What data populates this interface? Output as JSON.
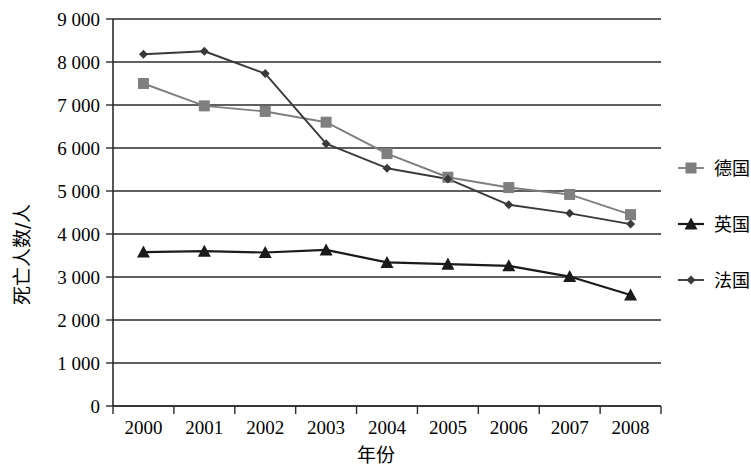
{
  "chart_data": {
    "type": "line",
    "title": "",
    "xlabel": "年份",
    "ylabel": "死亡人数/人",
    "categories": [
      "2000",
      "2001",
      "2002",
      "2003",
      "2004",
      "2005",
      "2006",
      "2007",
      "2008"
    ],
    "x": [
      2000,
      2001,
      2002,
      2003,
      2004,
      2005,
      2006,
      2007,
      2008
    ],
    "ylim": [
      0,
      9000
    ],
    "ytick_values": [
      0,
      1000,
      2000,
      3000,
      4000,
      5000,
      6000,
      7000,
      8000,
      9000
    ],
    "ytick_labels": [
      "0",
      "1 000",
      "2 000",
      "3 000",
      "4 000",
      "5 000",
      "6 000",
      "7 000",
      "8 000",
      "9 000"
    ],
    "grid": true,
    "grid_axis": "y",
    "legend_position": "right",
    "series": [
      {
        "name": "德国",
        "marker": "square",
        "color": "#7f7f7f",
        "values": [
          7500,
          6980,
          6850,
          6600,
          5870,
          5320,
          5080,
          4920,
          4450
        ]
      },
      {
        "name": "英国",
        "marker": "triangle",
        "color": "#1a1a1a",
        "values": [
          3580,
          3600,
          3570,
          3630,
          3340,
          3300,
          3260,
          3010,
          2580
        ]
      },
      {
        "name": "法国",
        "marker": "diamond",
        "color": "#3a3a3a",
        "values": [
          8180,
          8250,
          7730,
          6100,
          5530,
          5280,
          4680,
          4480,
          4230
        ]
      }
    ]
  },
  "axes": {
    "y_title": "死亡人数/人",
    "x_title": "年份"
  },
  "legend": {
    "entries": [
      {
        "label": "德国"
      },
      {
        "label": "英国"
      },
      {
        "label": "法国"
      }
    ]
  }
}
